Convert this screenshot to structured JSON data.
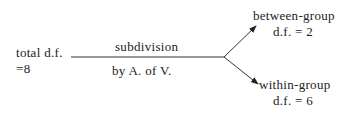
{
  "diagram": {
    "source": {
      "line1": "total d.f.",
      "line2": "=8"
    },
    "edge": {
      "label_top": "subdivision",
      "label_bottom": "by A. of V."
    },
    "branches": [
      {
        "line1": "between-group",
        "line2": "d.f. = 2"
      },
      {
        "line1": "within-group",
        "line2": "d.f. = 6"
      }
    ]
  }
}
